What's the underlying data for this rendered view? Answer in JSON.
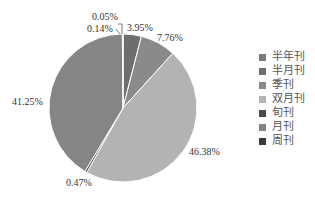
{
  "chart_data": {
    "type": "pie",
    "title": "",
    "categories": [
      "半年刊",
      "半月刊",
      "季刊",
      "双月刊",
      "旬刊",
      "月刊",
      "周刊"
    ],
    "values": [
      0.05,
      3.95,
      7.76,
      46.38,
      0.47,
      41.25,
      0.14
    ],
    "value_labels": [
      "0.05%",
      "3.95%",
      "7.76%",
      "46.38%",
      "0.47%",
      "41.25%",
      "0.14%"
    ],
    "unit": "%",
    "start_angle": "12 o'clock",
    "direction": "clockwise",
    "colors": [
      "#7a7a7a",
      "#6e6e6e",
      "#8a8a8a",
      "#b3b3b3",
      "#4a4a4a",
      "#858585",
      "#3a3a3a"
    ],
    "legend_position": "right"
  },
  "labels": {
    "l0": "0.05%",
    "l1": "3.95%",
    "l2": "7.76%",
    "l3": "46.38%",
    "l4": "0.47%",
    "l5": "41.25%",
    "l6": "0.14%"
  },
  "legend": [
    {
      "label": "半年刊",
      "color": "#7a7a7a"
    },
    {
      "label": "半月刊",
      "color": "#6e6e6e"
    },
    {
      "label": "季刊",
      "color": "#8a8a8a"
    },
    {
      "label": "双月刊",
      "color": "#b3b3b3"
    },
    {
      "label": "旬刊",
      "color": "#4a4a4a"
    },
    {
      "label": "月刊",
      "color": "#858585"
    },
    {
      "label": "周刊",
      "color": "#3a3a3a"
    }
  ]
}
